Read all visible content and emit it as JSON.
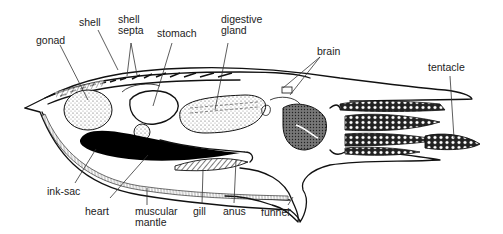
{
  "diagram": {
    "colors": {
      "ink": "#111111",
      "background": "#ffffff",
      "label": "#222222",
      "ink_sac": "#000000",
      "stipple": "#bbbbbb"
    },
    "labels": {
      "gonad": "gonad",
      "shell": "shell",
      "shell_septa": "shell\nsepta",
      "stomach": "stomach",
      "digestive_gland": "digestive\ngland",
      "brain": "brain",
      "tentacle": "tentacle",
      "ink_sac": "ink-sac",
      "heart": "heart",
      "muscular_mantle": "muscular\nmantle",
      "gill": "gill",
      "anus": "anus",
      "funnel": "funnel"
    }
  }
}
